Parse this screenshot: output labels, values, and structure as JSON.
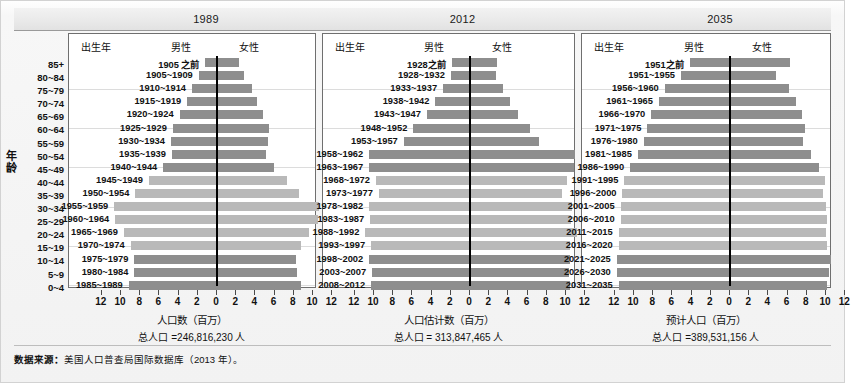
{
  "figure": {
    "yaxis_title": "年龄",
    "source_prefix": "数据来源：",
    "source_text": "美国人口普查局国际数据库（2013 年）。"
  },
  "age_groups": [
    "85+",
    "80~84",
    "75~79",
    "70~74",
    "65~69",
    "60~64",
    "55~59",
    "50~54",
    "45~49",
    "40~44",
    "35~39",
    "30~34",
    "25~29",
    "20~24",
    "15~19",
    "10~14",
    "5~9",
    "0~4"
  ],
  "headers": {
    "birth_year": "出生年",
    "male": "男性",
    "female": "女性"
  },
  "axis_ticks": [
    "12",
    "10",
    "8",
    "6",
    "4",
    "2",
    "0",
    "2",
    "4",
    "6",
    "8",
    "10",
    "12"
  ],
  "chart_data": [
    {
      "type": "bar",
      "title": "1989",
      "xlabel": "人口数（百万）",
      "total_label": "总人口 =246,816,230 人",
      "ylabel": "年龄",
      "xlim": [
        -12,
        12
      ],
      "grid": true,
      "categories": [
        "85+",
        "80~84",
        "75~79",
        "70~74",
        "65~69",
        "60~64",
        "55~59",
        "50~54",
        "45~49",
        "40~44",
        "35~39",
        "30~34",
        "25~29",
        "20~24",
        "15~19",
        "10~14",
        "5~9",
        "0~4"
      ],
      "cohorts": [
        "1905 之前",
        "1905~1909",
        "1910~1914",
        "1915~1919",
        "1920~1924",
        "1925~1929",
        "1930~1934",
        "1935~1939",
        "1940~1944",
        "1945~1949",
        "1950~1954",
        "1955~1959",
        "1960~1964",
        "1965~1969",
        "1970~1974",
        "1975~1979",
        "1980~1984",
        "1985~1989"
      ],
      "shade": [
        "dark",
        "dark",
        "dark",
        "dark",
        "dark",
        "dark",
        "dark",
        "dark",
        "dark",
        "light",
        "light",
        "light",
        "light",
        "light",
        "light",
        "dark",
        "dark",
        "dark"
      ],
      "series": [
        {
          "name": "男性",
          "values": [
            1.2,
            1.9,
            2.6,
            3.1,
            3.9,
            4.6,
            4.8,
            4.7,
            5.6,
            7.1,
            8.5,
            10.7,
            10.6,
            9.7,
            9.0,
            8.6,
            8.6,
            9.2
          ]
        },
        {
          "name": "女性",
          "values": [
            2.3,
            2.8,
            3.6,
            4.2,
            4.8,
            5.4,
            5.3,
            5.1,
            5.9,
            7.3,
            8.5,
            10.6,
            10.5,
            9.6,
            8.7,
            8.2,
            8.3,
            8.8
          ]
        }
      ]
    },
    {
      "type": "bar",
      "title": "2012",
      "xlabel": "人口估计数（百万）",
      "total_label": "总人口 = 313,847,465 人",
      "ylabel": "年龄",
      "xlim": [
        -12,
        12
      ],
      "grid": true,
      "categories": [
        "85+",
        "80~84",
        "75~79",
        "70~74",
        "65~69",
        "60~64",
        "55~59",
        "50~54",
        "45~49",
        "40~44",
        "35~39",
        "30~34",
        "25~29",
        "20~24",
        "15~19",
        "10~14",
        "5~9",
        "0~4"
      ],
      "cohorts": [
        "1928之前",
        "1928~1932",
        "1933~1937",
        "1938~1942",
        "1943~1947",
        "1948~1952",
        "1953~1957",
        "1958~1962",
        "1963~1967",
        "1968~1972",
        "1973~1977",
        "1978~1982",
        "1983~1987",
        "1988~1992",
        "1993~1997",
        "1998~2002",
        "2003~2007",
        "2008~2012"
      ],
      "shade": [
        "dark",
        "dark",
        "dark",
        "dark",
        "dark",
        "dark",
        "dark",
        "dark",
        "dark",
        "light",
        "light",
        "light",
        "light",
        "light",
        "light",
        "dark",
        "dark",
        "dark"
      ],
      "series": [
        {
          "name": "男性",
          "values": [
            1.9,
            2.0,
            2.8,
            3.6,
            4.5,
            5.9,
            6.9,
            10.5,
            10.5,
            9.8,
            9.5,
            10.5,
            10.4,
            10.9,
            10.3,
            10.5,
            10.2,
            10.3
          ]
        },
        {
          "name": "女性",
          "values": [
            2.8,
            2.7,
            3.4,
            4.2,
            5.0,
            6.2,
            7.2,
            10.9,
            10.8,
            10.1,
            9.6,
            10.6,
            10.5,
            11.1,
            10.4,
            10.4,
            10.3,
            10.4
          ]
        }
      ]
    },
    {
      "type": "bar",
      "title": "2035",
      "xlabel": "预计人口（百万）",
      "total_label": "总人口 =389,531,156 人",
      "ylabel": "年龄",
      "xlim": [
        -12,
        12
      ],
      "grid": true,
      "categories": [
        "85+",
        "80~84",
        "75~79",
        "70~74",
        "65~69",
        "60~64",
        "55~59",
        "50~54",
        "45~49",
        "40~44",
        "35~39",
        "30~34",
        "25~29",
        "20~24",
        "15~19",
        "10~14",
        "5~9",
        "0~4"
      ],
      "cohorts": [
        "1951之前",
        "1951~1955",
        "1956~1960",
        "1961~1965",
        "1966~1970",
        "1971~1975",
        "1976~1980",
        "1981~1985",
        "1986~1990",
        "1991~1995",
        "1996~2000",
        "2001~2005",
        "2006~2010",
        "2011~2015",
        "2016~2020",
        "2021~2025",
        "2026~2030",
        "2031~2035"
      ],
      "shade": [
        "dark",
        "dark",
        "dark",
        "dark",
        "dark",
        "dark",
        "dark",
        "dark",
        "dark",
        "light",
        "light",
        "light",
        "light",
        "light",
        "light",
        "dark",
        "dark",
        "dark"
      ],
      "series": [
        {
          "name": "男性",
          "values": [
            4.2,
            5.1,
            6.8,
            7.4,
            8.2,
            8.6,
            9.0,
            9.6,
            10.4,
            11.0,
            11.2,
            11.4,
            11.4,
            11.6,
            11.6,
            11.8,
            11.8,
            11.6
          ]
        },
        {
          "name": "女性",
          "values": [
            6.2,
            4.8,
            6.1,
            6.9,
            7.5,
            7.8,
            7.6,
            8.4,
            9.3,
            9.9,
            9.7,
            10.0,
            10.1,
            10.0,
            10.1,
            10.5,
            10.3,
            10.1
          ]
        }
      ]
    }
  ]
}
